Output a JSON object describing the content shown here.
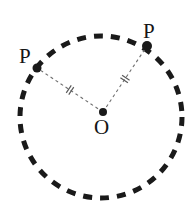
{
  "figure": {
    "type": "geometry-diagram",
    "background_color": "#ffffff",
    "canvas": {
      "width": 196,
      "height": 221
    }
  },
  "circle": {
    "name": "dashed-circle",
    "center_x": 101,
    "center_y": 117,
    "radius": 81,
    "stroke_color": "#1a1a1a",
    "stroke_width": 5,
    "dash_pattern": "9 8",
    "fill": "none"
  },
  "points": [
    {
      "id": "center",
      "label": "O",
      "x": 103,
      "y": 112,
      "dot_radius": 4,
      "dot_color": "#1a1a1a",
      "label_x": 94,
      "label_y": 117
    },
    {
      "id": "p-left",
      "label": "P",
      "x": 37,
      "y": 68,
      "dot_radius": 4.5,
      "dot_color": "#1a1a1a",
      "label_x": 19,
      "label_y": 46
    },
    {
      "id": "p-right",
      "label": "P",
      "x": 147,
      "y": 46,
      "dot_radius": 5,
      "dot_color": "#1a1a1a",
      "label_x": 143,
      "label_y": 21
    }
  ],
  "radii": [
    {
      "id": "radius-left",
      "from": "center",
      "to": "p-left",
      "x1": 103,
      "y1": 112,
      "x2": 37,
      "y2": 68,
      "stroke_color": "#6e6e6e",
      "stroke_width": 1.1,
      "dash_pattern": "3 3",
      "tick_count": 2,
      "tick_label": "congruent-radius-mark"
    },
    {
      "id": "radius-right",
      "from": "center",
      "to": "p-right",
      "x1": 103,
      "y1": 112,
      "x2": 147,
      "y2": 46,
      "stroke_color": "#6e6e6e",
      "stroke_width": 1.1,
      "dash_pattern": "3 3",
      "tick_count": 2,
      "tick_label": "congruent-radius-mark"
    }
  ],
  "tick_marks": {
    "stroke_color": "#5a5a5a",
    "stroke_width": 1.2,
    "length": 9,
    "separation": 3
  },
  "labels": {
    "p_left": "P",
    "p_right": "P",
    "center": "O"
  }
}
